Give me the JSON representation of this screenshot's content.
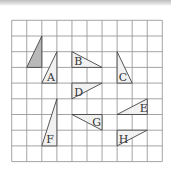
{
  "diagram": {
    "title": "",
    "grid": {
      "columns": 10,
      "rows": 9
    },
    "colors": {
      "grid": "#9a9a9a",
      "outline": "#444444",
      "shaded_fill": "#b9b9b9",
      "light_fill": "#f1f1f1",
      "label": "#333333"
    },
    "shapes": [
      {
        "name": "original",
        "label": "",
        "shaded": true,
        "vertices": [
          [
            2,
            1
          ],
          [
            1,
            3
          ],
          [
            2,
            3
          ]
        ],
        "label_at": null
      },
      {
        "name": "A",
        "label": "A",
        "shaded": false,
        "vertices": [
          [
            3,
            2
          ],
          [
            2,
            4
          ],
          [
            3,
            4
          ]
        ],
        "label_at": [
          2.35,
          3.85
        ]
      },
      {
        "name": "B",
        "label": "B",
        "shaded": false,
        "vertices": [
          [
            4,
            2
          ],
          [
            4,
            3
          ],
          [
            6,
            3
          ]
        ],
        "label_at": [
          4.15,
          2.82
        ]
      },
      {
        "name": "C",
        "label": "C",
        "shaded": false,
        "vertices": [
          [
            7,
            2
          ],
          [
            7,
            4
          ],
          [
            8,
            4
          ]
        ],
        "label_at": [
          7.1,
          3.85
        ]
      },
      {
        "name": "D",
        "label": "D",
        "shaded": false,
        "vertices": [
          [
            4,
            4
          ],
          [
            6,
            4
          ],
          [
            4,
            5
          ]
        ],
        "label_at": [
          4.15,
          4.82
        ]
      },
      {
        "name": "E",
        "label": "E",
        "shaded": false,
        "vertices": [
          [
            9,
            5
          ],
          [
            7,
            6
          ],
          [
            9,
            6
          ]
        ],
        "label_at": [
          8.5,
          5.85
        ]
      },
      {
        "name": "F",
        "label": "F",
        "shaded": false,
        "vertices": [
          [
            3,
            5
          ],
          [
            2,
            8
          ],
          [
            3,
            8
          ]
        ],
        "label_at": [
          2.3,
          7.8
        ]
      },
      {
        "name": "G",
        "label": "G",
        "shaded": false,
        "vertices": [
          [
            4,
            6
          ],
          [
            6,
            6
          ],
          [
            6,
            7
          ]
        ],
        "label_at": [
          5.35,
          6.75
        ]
      },
      {
        "name": "H",
        "label": "H",
        "shaded": false,
        "vertices": [
          [
            7,
            7
          ],
          [
            9,
            7
          ],
          [
            7,
            8
          ]
        ],
        "label_at": [
          7.1,
          7.82
        ]
      }
    ]
  }
}
